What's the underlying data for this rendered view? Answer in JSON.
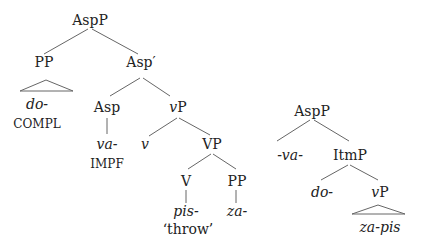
{
  "tree1": {
    "root": "AspP",
    "pp": "PP",
    "pp_leaf": "do-",
    "pp_gloss": "COMPL",
    "asp_bar": "Asp′",
    "asp": "Asp",
    "asp_leaf": "va-",
    "asp_gloss": "IMPF",
    "vp_small": "vP",
    "v": "v",
    "vp": "VP",
    "verb": "V",
    "pp2": "PP",
    "verb_leaf": "pis-",
    "verb_gloss": "‘throw’",
    "pp2_leaf": "za-"
  },
  "tree2": {
    "root": "AspP",
    "spec": "-va-",
    "itmp": "ItmP",
    "itm_spec": "do-",
    "vp_small": "vP",
    "vp_leaf": "za-pis"
  },
  "colors": {
    "line": "#555555",
    "text": "#222222"
  }
}
